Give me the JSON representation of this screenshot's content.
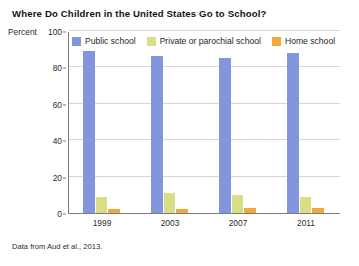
{
  "chart_data": {
    "type": "bar",
    "title": "Where Do Children in the United States Go to School?",
    "xlabel": "",
    "ylabel": "Percent",
    "categories": [
      "1999",
      "2003",
      "2007",
      "2011"
    ],
    "series": [
      {
        "name": "Public school",
        "color": "#8395dd",
        "values": [
          89,
          86,
          85,
          88
        ]
      },
      {
        "name": "Private or parochial school",
        "color": "#d9dd83",
        "values": [
          9,
          11,
          10,
          9
        ]
      },
      {
        "name": "Home school",
        "color": "#f0a93a",
        "values": [
          2,
          2,
          3,
          3
        ]
      }
    ],
    "ylim": [
      0,
      100
    ],
    "yticks": [
      0,
      20,
      40,
      60,
      80,
      100
    ],
    "ytick_labels": [
      "0",
      "20",
      "40",
      "60",
      "80",
      "100"
    ],
    "grid": true,
    "legend_position": "top",
    "source_note": "Data from Aud et al., 2013."
  }
}
